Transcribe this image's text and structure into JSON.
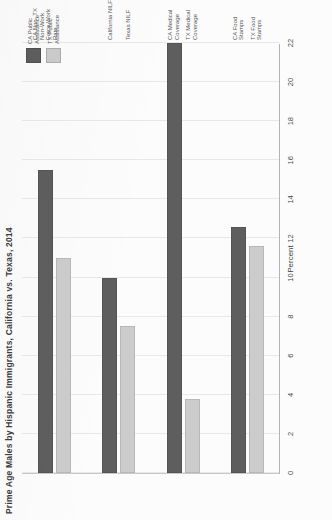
{
  "chart": {
    "title": "Prime Age Males by Hispanic Immigrants, California vs. Texas, 2014",
    "axis_title": "Percent"
  },
  "legend": {
    "position": "top-right",
    "items": [
      {
        "label": "CA Public Assistance",
        "color": "#5e5e5e"
      },
      {
        "label": "TX Public Assistance",
        "color": "#cccccc"
      }
    ]
  },
  "chart_data": {
    "type": "bar",
    "orientation": "vertical",
    "title": "Prime Age Males by Hispanic Immigrants, California vs. Texas, 2014",
    "xlabel": "",
    "ylabel": "Percent",
    "ylim": [
      0,
      22
    ],
    "grid": true,
    "tick_labels": [
      "22",
      "20",
      "18",
      "16",
      "14",
      "12",
      "10",
      "8",
      "6",
      "4",
      "2",
      "0"
    ],
    "tick_values": [
      22,
      20,
      18,
      16,
      14,
      12,
      10,
      8,
      6,
      4,
      2,
      0
    ],
    "categories": [
      "CA Non- TX Non-Work Force Work Rate",
      "California NILF",
      "Texas NILF",
      "CA Medical Coverage",
      "TX Medical Coverage",
      "CA Food Stamps",
      "TX Food Stamps"
    ],
    "bars": [
      {
        "label": "CA Non-Work Force Rate",
        "value": 15.5,
        "color": "#5e5e5e"
      },
      {
        "label": "TX Non-Work Force Rate",
        "value": 11.0,
        "color": "#cccccc"
      },
      {
        "label": "California NILF",
        "value": 10.0,
        "color": "#5e5e5e"
      },
      {
        "label": "Texas NILF",
        "value": 7.5,
        "color": "#cccccc"
      },
      {
        "label": "CA Medical Coverage",
        "value": 22.0,
        "color": "#5e5e5e"
      },
      {
        "label": "TX Medical Coverage",
        "value": 3.8,
        "color": "#cccccc"
      },
      {
        "label": "CA Food Stamps",
        "value": 12.6,
        "color": "#5e5e5e"
      },
      {
        "label": "TX Food Stamps",
        "value": 11.6,
        "color": "#cccccc"
      }
    ],
    "groups": [
      {
        "name": "work-force",
        "category_label": "CA Non- TX Non-Work Force Work Rate",
        "bars": [
          {
            "series": "CA Public Assistance",
            "value": 15.5
          },
          {
            "series": "TX Public Assistance",
            "value": 11.0
          }
        ]
      },
      {
        "name": "nilf",
        "category_label_primary": "California NILF",
        "category_label_secondary": "Texas NILF",
        "bars": [
          {
            "series": "CA Public Assistance",
            "value": 10.0
          },
          {
            "series": "TX Public Assistance",
            "value": 7.5
          }
        ]
      },
      {
        "name": "medical-coverage",
        "category_label_primary": "CA Medical Coverage",
        "category_label_secondary": "TX Medical Coverage",
        "bars": [
          {
            "series": "CA Public Assistance",
            "value": 22.0
          },
          {
            "series": "TX Public Assistance",
            "value": 3.8
          }
        ]
      },
      {
        "name": "food-stamps",
        "category_label_primary": "CA Food Stamps",
        "category_label_secondary": "TX Food Stamps",
        "bars": [
          {
            "series": "CA Public Assistance",
            "value": 12.6
          },
          {
            "series": "TX Public Assistance",
            "value": 11.6
          }
        ]
      }
    ],
    "category_labels": [
      {
        "id": "ca-nonwork",
        "text": "CA Non- TX Non-Work Force Work Rate"
      },
      {
        "id": "california-nilf",
        "text": "California NILF"
      },
      {
        "id": "texas-nilf",
        "text": "Texas NILF"
      },
      {
        "id": "ca-medical",
        "text": "CA Medical Coverage"
      },
      {
        "id": "tx-medical",
        "text": "TX Medical Coverage"
      },
      {
        "id": "ca-food",
        "text": "CA Food Stamps"
      },
      {
        "id": "tx-food",
        "text": "TX Food Stamps"
      }
    ]
  },
  "colors": {
    "series_dark": "#5e5e5e",
    "series_light": "#cccccc",
    "grid": "#e8e8e8",
    "axis": "#b4b4b4",
    "page": "#fcfcfc"
  }
}
